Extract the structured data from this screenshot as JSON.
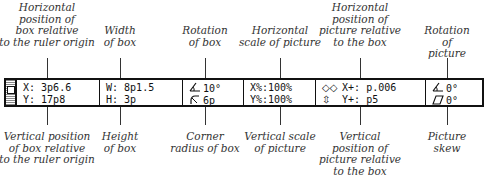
{
  "top_labels": [
    {
      "id": "h-pos-box",
      "text": "Horizontal\nposition of\nbox relative\nto the ruler origin",
      "x": 47
    },
    {
      "id": "width-box",
      "text": "Width\nof box",
      "x": 120
    },
    {
      "id": "rotation-box",
      "text": "Rotation\nof box",
      "x": 205
    },
    {
      "id": "h-scale-pic",
      "text": "Horizontal\nscale of picture",
      "x": 280
    },
    {
      "id": "h-pos-pic",
      "text": "Horizontal\nposition of\npicture relative\nto the box",
      "x": 360
    },
    {
      "id": "rotation-pic",
      "text": "Rotation\nof picture",
      "x": 447
    }
  ],
  "bottom_labels": [
    {
      "id": "v-pos-box",
      "text": "Vertical position\nof box relative\nto the ruler origin",
      "x": 47
    },
    {
      "id": "height-box",
      "text": "Height\nof box",
      "x": 120
    },
    {
      "id": "corner-radius",
      "text": "Corner\nradius of box",
      "x": 205
    },
    {
      "id": "v-scale-pic",
      "text": "Vertical scale\nof picture",
      "x": 280
    },
    {
      "id": "v-pos-pic",
      "text": "Vertical\nposition of\npicture relative\nto the box",
      "x": 360
    },
    {
      "id": "skew-pic",
      "text": "Picture\nskew",
      "x": 447
    }
  ],
  "palette": {
    "box_position": {
      "x_label": "X:",
      "x_value": "3p6.6",
      "y_label": "Y:",
      "y_value": "17p8"
    },
    "box_size": {
      "w_label": "W:",
      "w_value": "8p1.5",
      "h_label": "H:",
      "h_value": "3p"
    },
    "box_rotation": {
      "rotation_icon": "rotation-icon",
      "rotation_value": "10°",
      "radius_icon": "corner-radius-icon",
      "radius_value": "6p"
    },
    "picture_scale": {
      "x_label": "X%:",
      "x_value": "100%",
      "y_label": "Y%:",
      "y_value": "100%"
    },
    "picture_offset": {
      "x_icon": "horizontal-arrows-icon",
      "x_label": "X+:",
      "x_value": "p.006",
      "y_icon": "vertical-arrows-icon",
      "y_label": "Y+:",
      "y_value": "p5"
    },
    "picture_transform": {
      "rotation_icon": "rotation-icon",
      "rotation_value": "0°",
      "skew_icon": "skew-icon",
      "skew_value": "0°"
    }
  }
}
